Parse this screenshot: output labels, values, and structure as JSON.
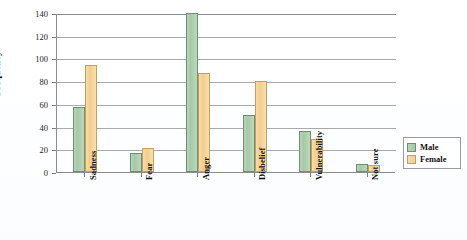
{
  "chart_data": {
    "type": "bar",
    "title": "",
    "xlabel": "",
    "ylabel": "Frequency",
    "ylim": [
      0,
      140
    ],
    "yticks": [
      0,
      20,
      40,
      60,
      80,
      100,
      120,
      140
    ],
    "ytick_labels": [
      "0",
      "20",
      "40",
      "60",
      "80",
      "100",
      "120",
      "140"
    ],
    "grid": true,
    "legend_position": "right",
    "categories": [
      "Sadness",
      "Fear",
      "Anger",
      "Disbelief",
      "Vulnerability",
      "Not sure"
    ],
    "series": [
      {
        "name": "Male",
        "color": "#a6c9a8",
        "values": [
          57,
          17,
          140,
          50,
          36,
          7
        ]
      },
      {
        "name": "Female",
        "color": "#f2cd8e",
        "values": [
          94,
          21,
          87,
          80,
          29,
          6
        ]
      }
    ]
  },
  "legend": {
    "items": [
      {
        "label": "Male"
      },
      {
        "label": "Female"
      }
    ]
  }
}
